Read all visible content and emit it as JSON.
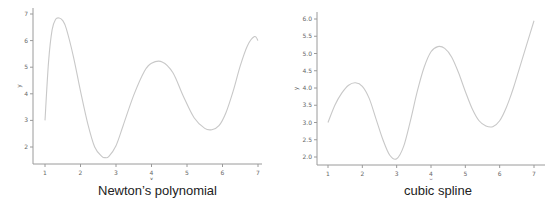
{
  "chart_data": [
    {
      "type": "line",
      "title": "Newton's polynomial",
      "xlabel": "x",
      "ylabel": "y",
      "xlim": [
        0.7,
        7.2
      ],
      "ylim": [
        1.35,
        7.05
      ],
      "xticks": [
        1,
        2,
        3,
        4,
        5,
        6,
        7
      ],
      "yticks": [
        2,
        3,
        4,
        5,
        6,
        7
      ],
      "ytick_labels": [
        "2",
        "3",
        "4",
        "5",
        "6",
        "7"
      ],
      "grid": false,
      "line_color": "#c8c8c8",
      "series": [
        {
          "name": "Newton's polynomial",
          "x": [
            1.0,
            1.1,
            1.2,
            1.3,
            1.4,
            1.5,
            1.6,
            1.8,
            2.0,
            2.2,
            2.4,
            2.6,
            2.7,
            2.8,
            3.0,
            3.2,
            3.5,
            3.8,
            4.0,
            4.3,
            4.6,
            4.9,
            5.2,
            5.5,
            5.7,
            5.9,
            6.1,
            6.3,
            6.5,
            6.7,
            6.9,
            7.0
          ],
          "y": [
            3.0,
            5.2,
            6.4,
            6.8,
            6.85,
            6.75,
            6.45,
            5.4,
            4.1,
            2.9,
            2.0,
            1.65,
            1.6,
            1.65,
            2.05,
            2.8,
            3.95,
            4.85,
            5.15,
            5.2,
            4.8,
            3.9,
            3.1,
            2.7,
            2.65,
            2.8,
            3.3,
            4.1,
            5.05,
            5.8,
            6.15,
            6.0
          ]
        }
      ]
    },
    {
      "type": "line",
      "title": "cubic spline",
      "xlabel": "x",
      "ylabel": "y",
      "xlim": [
        0.7,
        7.3
      ],
      "ylim": [
        1.75,
        6.2
      ],
      "xticks": [
        1,
        2,
        3,
        4,
        5,
        6,
        7
      ],
      "yticks": [
        2.0,
        2.5,
        3.0,
        3.5,
        4.0,
        4.5,
        5.0,
        5.5,
        6.0
      ],
      "ytick_labels": [
        "2.0",
        "2.5",
        "3.0",
        "3.5",
        "4.0",
        "4.5",
        "5.0",
        "5.5",
        "6.0"
      ],
      "grid": false,
      "line_color": "#c8c8c8",
      "series": [
        {
          "name": "cubic spline",
          "x": [
            1.0,
            1.2,
            1.4,
            1.6,
            1.8,
            2.0,
            2.2,
            2.4,
            2.6,
            2.8,
            3.0,
            3.2,
            3.4,
            3.6,
            3.8,
            4.0,
            4.2,
            4.4,
            4.6,
            4.8,
            5.0,
            5.2,
            5.4,
            5.6,
            5.8,
            6.0,
            6.2,
            6.4,
            6.6,
            6.8,
            7.0
          ],
          "y": [
            3.0,
            3.5,
            3.85,
            4.08,
            4.15,
            4.05,
            3.7,
            3.1,
            2.5,
            2.05,
            1.95,
            2.3,
            3.05,
            3.9,
            4.6,
            5.05,
            5.2,
            5.15,
            4.9,
            4.45,
            3.9,
            3.4,
            3.05,
            2.9,
            2.88,
            3.05,
            3.45,
            4.0,
            4.65,
            5.3,
            5.95
          ]
        }
      ]
    }
  ],
  "panels": {
    "left": {
      "caption": "Newton’s polynomial",
      "xlabel": "x",
      "ylabel": "y"
    },
    "right": {
      "caption": "cubic spline",
      "xlabel": "x",
      "ylabel": "y"
    }
  },
  "style": {
    "axis_color": "#9a9a9a",
    "tick_label_color": "#666666",
    "line_color": "#c8c8c8"
  }
}
